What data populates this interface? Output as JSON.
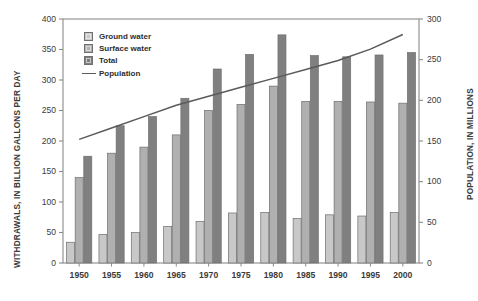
{
  "chart_data": {
    "type": "bar",
    "title": "",
    "subtitle": "",
    "xlabel": "",
    "ylabel": "WITHDRAWALS, IN BILLION GALLONS PER DAY",
    "y2label": "POPULATION, IN MILLIONS",
    "categories": [
      "1950",
      "1955",
      "1960",
      "1965",
      "1970",
      "1975",
      "1980",
      "1985",
      "1990",
      "1995",
      "2000"
    ],
    "ylim": [
      0,
      400
    ],
    "y2lim": [
      0,
      300
    ],
    "yticks": [
      0,
      50,
      100,
      150,
      200,
      250,
      300,
      350,
      400
    ],
    "y2ticks": [
      0,
      50,
      100,
      150,
      200,
      250,
      300
    ],
    "grid": false,
    "legend_position": "upper-left",
    "series": [
      {
        "name": "Ground water",
        "kind": "bar",
        "color": "#c8c8c8",
        "axis": "left",
        "values": [
          34,
          47,
          50,
          60,
          68,
          82,
          83,
          73,
          79,
          77,
          83
        ]
      },
      {
        "name": "Surface water",
        "kind": "bar",
        "color": "#b0b0b0",
        "axis": "left",
        "values": [
          140,
          180,
          190,
          210,
          250,
          260,
          290,
          265,
          265,
          264,
          262
        ]
      },
      {
        "name": "Total",
        "kind": "bar",
        "color": "#808080",
        "axis": "left",
        "values": [
          175,
          225,
          240,
          270,
          318,
          342,
          374,
          340,
          338,
          341,
          345
        ]
      },
      {
        "name": "Population",
        "kind": "line",
        "color": "#5a5a5a",
        "axis": "right",
        "values": [
          152,
          166,
          180,
          194,
          205,
          216,
          227,
          238,
          249,
          263,
          281
        ]
      }
    ]
  },
  "legend": {
    "items": [
      {
        "label": "Ground water",
        "swatch": "#c8c8c8",
        "marker": "square"
      },
      {
        "label": "Surface water",
        "swatch": "#b0b0b0",
        "marker": "square"
      },
      {
        "label": "Total",
        "swatch": "#808080",
        "marker": "square"
      },
      {
        "label": "Population",
        "swatch": "#5a5a5a",
        "marker": "line"
      }
    ]
  },
  "axes": {
    "left_title": "WITHDRAWALS, IN BILLION GALLONS PER DAY",
    "right_title": "POPULATION, IN MILLIONS",
    "left_ticks": [
      "400",
      "350",
      "300",
      "250",
      "200",
      "150",
      "100",
      "50",
      "0"
    ],
    "right_ticks": [
      "300",
      "250",
      "200",
      "150",
      "100",
      "50",
      "0"
    ],
    "bottom_ticks": [
      "1950",
      "1955",
      "1960",
      "1965",
      "1970",
      "1975",
      "1980",
      "1985",
      "1990",
      "1995",
      "2000"
    ]
  },
  "colors": {
    "frame": "#8a8a8a",
    "text": "#3b3b3b",
    "background": "#ffffff",
    "ground_water": "#c8c8c8",
    "surface_water": "#b0b0b0",
    "total": "#808080",
    "population_line": "#5a5a5a"
  }
}
